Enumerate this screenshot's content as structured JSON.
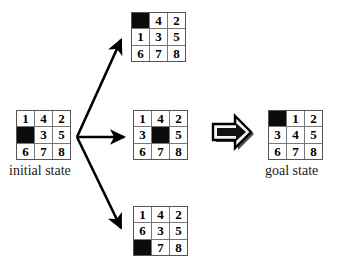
{
  "diagram": {
    "title_present": false,
    "colors": {
      "background": "#ffffff",
      "tile_fill": "#ffffff",
      "blank_tile": "#0b0b0b",
      "grid_line": "#777777",
      "grid_border": "#555555",
      "text": "#000000",
      "arrow": "#000000",
      "block_arrow_fill": "#f2f2f2",
      "block_arrow_shadow": "#555555"
    }
  },
  "initial_state": {
    "label": "initial state",
    "tiles": [
      [
        "1",
        "4",
        "2"
      ],
      [
        "",
        "3",
        "5"
      ],
      [
        "6",
        "7",
        "8"
      ]
    ],
    "blank": [
      1,
      0
    ]
  },
  "successors": [
    {
      "name": "successor-up",
      "tiles": [
        [
          "",
          "4",
          "2"
        ],
        [
          "1",
          "3",
          "5"
        ],
        [
          "6",
          "7",
          "8"
        ]
      ],
      "blank": [
        0,
        0
      ]
    },
    {
      "name": "successor-right",
      "tiles": [
        [
          "1",
          "4",
          "2"
        ],
        [
          "3",
          "",
          "5"
        ],
        [
          "6",
          "7",
          "8"
        ]
      ],
      "blank": [
        1,
        1
      ]
    },
    {
      "name": "successor-down",
      "tiles": [
        [
          "1",
          "4",
          "2"
        ],
        [
          "6",
          "3",
          "5"
        ],
        [
          "",
          "7",
          "8"
        ]
      ],
      "blank": [
        2,
        0
      ]
    }
  ],
  "goal_state": {
    "label": "goal state",
    "tiles": [
      [
        "",
        "1",
        "2"
      ],
      [
        "3",
        "4",
        "5"
      ],
      [
        "6",
        "7",
        "8"
      ]
    ],
    "blank": [
      0,
      0
    ]
  },
  "arrows": {
    "branch_up": "arrow-up-icon",
    "branch_right": "arrow-right-icon",
    "branch_down": "arrow-down-icon",
    "block": "block-arrow-right-icon"
  }
}
